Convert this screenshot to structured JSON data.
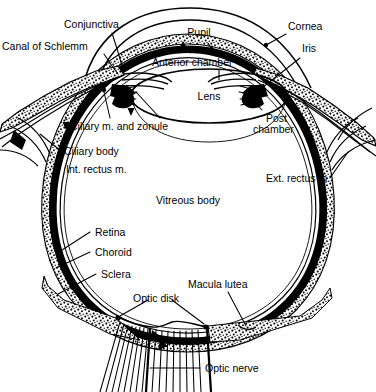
{
  "diagram": {
    "type": "anatomical-cross-section",
    "background_color": "#ffffff",
    "ink_color": "#000000",
    "label_font_size_px": 10.5
  },
  "labels": {
    "conjunctiva": "Conjunctiva",
    "canal_of_schlemm": "Canal of Schlemm",
    "pupil": "Pupil",
    "anterior_chamber": "Anterior chamber",
    "cornea": "Cornea",
    "iris": "Iris",
    "lens": "Lens",
    "post_chamber_line1": "Post",
    "post_chamber_line2": "chamber",
    "ciliary_m_and_zonule": "Ciliary m. and zonule",
    "ciliary_body": "Ciliary body",
    "int_rectus_m": "Int. rectus m.",
    "ext_rectus_m": "Ext. rectus m.",
    "vitreous_body": "Vitreous body",
    "retina": "Retina",
    "choroid": "Choroid",
    "sclera": "Sclera",
    "macula_lutea": "Macula lutea",
    "optic_disk": "Optic disk",
    "optic_nerve": "Optic nerve"
  },
  "structures": [
    {
      "name": "conjunctiva",
      "label": "Conjunctiva",
      "side": "upper-left"
    },
    {
      "name": "canal-of-schlemm",
      "label": "Canal of Schlemm",
      "side": "upper-left"
    },
    {
      "name": "pupil",
      "label": "Pupil",
      "side": "top-center"
    },
    {
      "name": "anterior-chamber",
      "label": "Anterior chamber",
      "side": "top-center"
    },
    {
      "name": "cornea",
      "label": "Cornea",
      "side": "upper-right"
    },
    {
      "name": "iris",
      "label": "Iris",
      "side": "upper-right"
    },
    {
      "name": "lens",
      "label": "Lens",
      "side": "center"
    },
    {
      "name": "post-chamber",
      "label": "Post chamber",
      "side": "right"
    },
    {
      "name": "ciliary-m-and-zonule",
      "label": "Ciliary m. and zonule",
      "side": "left"
    },
    {
      "name": "ciliary-body",
      "label": "Ciliary body",
      "side": "left"
    },
    {
      "name": "int-rectus-m",
      "label": "Int. rectus m.",
      "side": "left"
    },
    {
      "name": "ext-rectus-m",
      "label": "Ext. rectus m.",
      "side": "right"
    },
    {
      "name": "vitreous-body",
      "label": "Vitreous body",
      "side": "center"
    },
    {
      "name": "retina",
      "label": "Retina",
      "side": "lower-left"
    },
    {
      "name": "choroid",
      "label": "Choroid",
      "side": "lower-left"
    },
    {
      "name": "sclera",
      "label": "Sclera",
      "side": "lower-left"
    },
    {
      "name": "macula-lutea",
      "label": "Macula lutea",
      "side": "bottom-center"
    },
    {
      "name": "optic-disk",
      "label": "Optic disk",
      "side": "bottom-center"
    },
    {
      "name": "optic-nerve",
      "label": "Optic nerve",
      "side": "bottom-right"
    }
  ]
}
